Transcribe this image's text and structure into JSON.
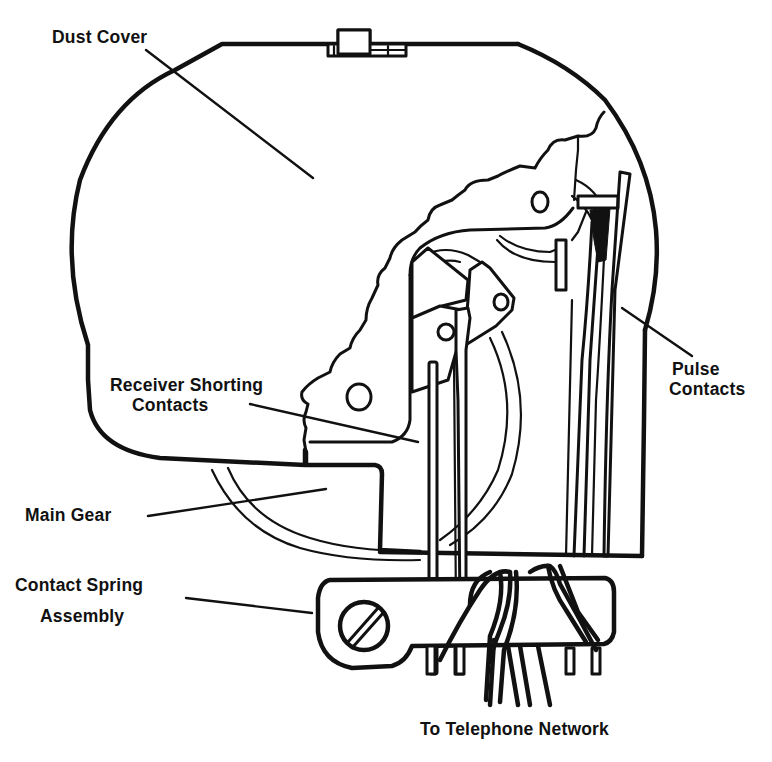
{
  "figure": {
    "type": "exploded technical illustration",
    "background_color": "#ffffff",
    "line_color": "#111111"
  },
  "labels": {
    "dust_cover": "Dust Cover",
    "receiver_shorting_line1": "Receiver Shorting",
    "receiver_shorting_line2": "Contacts",
    "pulse_line1": "Pulse",
    "pulse_line2": "Contacts",
    "main_gear": "Main Gear",
    "contact_spring_line1": "Contact Spring",
    "contact_spring_line2": "Assembly",
    "network": "To Telephone Network"
  },
  "components": [
    {
      "id": "dust-cover",
      "label": "Dust Cover"
    },
    {
      "id": "receiver-shorting-contacts",
      "label": "Receiver Shorting Contacts"
    },
    {
      "id": "pulse-contacts",
      "label": "Pulse Contacts"
    },
    {
      "id": "main-gear",
      "label": "Main Gear"
    },
    {
      "id": "contact-spring-assembly",
      "label": "Contact Spring Assembly"
    },
    {
      "id": "network-wires",
      "label": "To Telephone Network"
    }
  ]
}
